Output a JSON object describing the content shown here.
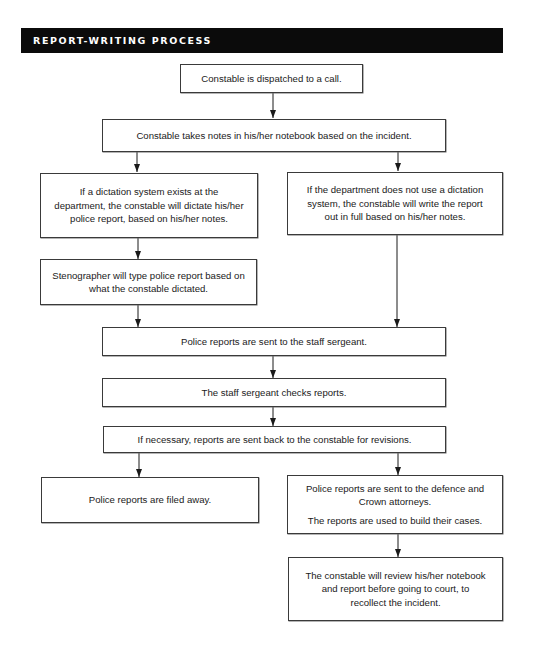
{
  "header": {
    "title": "REPORT-WRITING PROCESS"
  },
  "colors": {
    "header_bg": "#0b0b0b",
    "header_text": "#ffffff",
    "box_border": "#3a3a3a",
    "arrow": "#1a1a1a"
  },
  "steps": {
    "dispatched": {
      "text": "Constable is dispatched to a call."
    },
    "takes_notes": {
      "text": "Constable takes notes in his/her notebook based on the incident."
    },
    "dictation_exists": {
      "text": "If a dictation system exists at the department, the constable will dictate his/her police report, based on his/her notes."
    },
    "no_dictation": {
      "text": "If the department does not use a dictation system, the constable will write the report out in full based on his/her notes."
    },
    "stenographer": {
      "text": "Stenographer will type police report based on what the constable dictated."
    },
    "sent_to_sergeant": {
      "text": "Police reports are sent to the staff sergeant."
    },
    "sergeant_checks": {
      "text": "The staff sergeant checks reports."
    },
    "revisions": {
      "text": "If necessary, reports are sent back to the constable for revisions."
    },
    "filed_away": {
      "text": "Police reports are filed away."
    },
    "sent_to_attorneys": {
      "text": "Police reports are sent to the defence and Crown attorneys.",
      "text2": "The reports are used to build their cases."
    },
    "review_before_court": {
      "text": "The constable will review his/her notebook and report before going to court, to recollect the incident."
    }
  },
  "edges": [
    {
      "from": "dispatched",
      "to": "takes_notes"
    },
    {
      "from": "takes_notes",
      "to": "dictation_exists"
    },
    {
      "from": "takes_notes",
      "to": "no_dictation"
    },
    {
      "from": "dictation_exists",
      "to": "stenographer"
    },
    {
      "from": "stenographer",
      "to": "sent_to_sergeant"
    },
    {
      "from": "no_dictation",
      "to": "sent_to_sergeant"
    },
    {
      "from": "sent_to_sergeant",
      "to": "sergeant_checks"
    },
    {
      "from": "sergeant_checks",
      "to": "revisions"
    },
    {
      "from": "revisions",
      "to": "filed_away"
    },
    {
      "from": "revisions",
      "to": "sent_to_attorneys"
    },
    {
      "from": "sent_to_attorneys",
      "to": "review_before_court"
    }
  ]
}
